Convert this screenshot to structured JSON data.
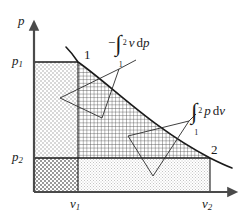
{
  "figure": {
    "type": "pv-work-diagram",
    "axes": {
      "y_axis_label": "p",
      "x_axis_label": "v",
      "y_ticks": [
        {
          "id": "p1",
          "base": "p",
          "sub": "1",
          "y_px": 62
        },
        {
          "id": "p2",
          "base": "p",
          "sub": "2",
          "y_px": 158
        }
      ],
      "x_ticks": [
        {
          "id": "v1",
          "base": "v",
          "sub": "1",
          "x_px": 78
        },
        {
          "id": "v2",
          "base": "v",
          "sub": "2",
          "x_px": 210
        }
      ],
      "origin_px": {
        "x": 34,
        "y": 192
      }
    },
    "points": [
      {
        "label": "1",
        "x_px": 78,
        "y_px": 62
      },
      {
        "label": "2",
        "x_px": 210,
        "y_px": 158
      }
    ],
    "annotations": [
      {
        "id": "minus-integral-v-dp",
        "sign": "−",
        "integral": "∫",
        "lower_limit": "1",
        "upper_limit": "2",
        "integrand_var": "v",
        "differential": "d",
        "differential_var": "p",
        "text": "−∫₁² v dp"
      },
      {
        "id": "integral-p-dv",
        "sign": "",
        "integral": "∫",
        "lower_limit": "1",
        "upper_limit": "2",
        "integrand_var": "p",
        "differential": "d",
        "differential_var": "v",
        "text": "∫₁² p dv"
      }
    ],
    "regions": [
      {
        "id": "upper-left-dotted",
        "pattern": "light-dotted-checker",
        "color": "#c9c9c9"
      },
      {
        "id": "center-crosshatch",
        "pattern": "fine-grid",
        "color": "#3a3a3a"
      },
      {
        "id": "lower-left-dark-checker",
        "pattern": "dark-checker",
        "color": "#8f8f8f"
      },
      {
        "id": "lower-right-light-dotted",
        "pattern": "fine-dots",
        "color": "#d6d6d6"
      }
    ],
    "colors": {
      "stroke": "#1a1a1a",
      "axis": "#4a4a4a",
      "background": "#ffffff",
      "curve": "#1a1a1a"
    }
  }
}
